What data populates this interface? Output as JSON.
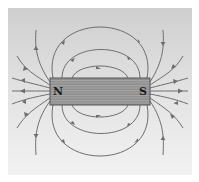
{
  "diagram": {
    "title": "",
    "magnet": {
      "north_label": "N",
      "south_label": "S",
      "fill_color": "#8a8a8a",
      "stripe_color": "#a0a0a0"
    },
    "field_line_color": "#6e6e6e",
    "arrow_direction": "from N to S (outside the magnet)",
    "background_color": "#dcdcdc"
  }
}
